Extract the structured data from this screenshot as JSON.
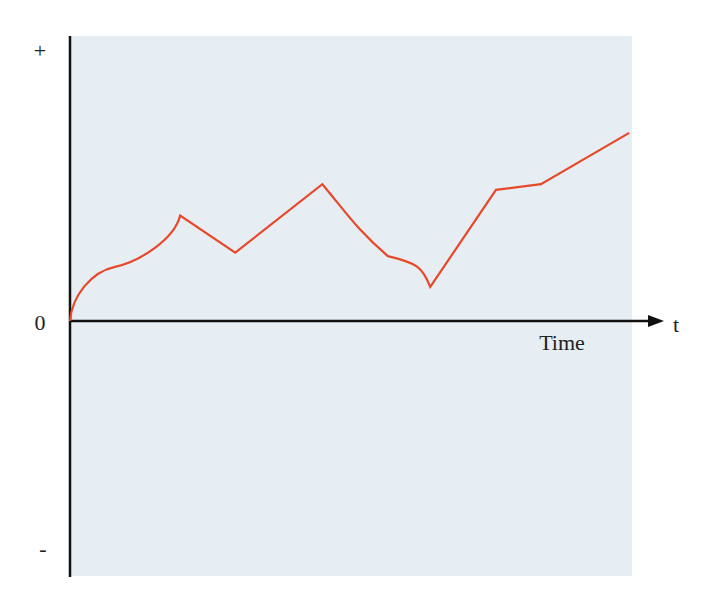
{
  "chart_data": {
    "type": "line",
    "title": "",
    "xlabel": "Time",
    "ylabel": "",
    "x_axis_end_label": "t",
    "y_tick_labels": {
      "top": "+",
      "zero": "0",
      "bottom": "-"
    },
    "grid": false,
    "legend": null,
    "colors": {
      "line": "#e8482a",
      "background": "#e6eef3",
      "axis": "#111111"
    },
    "note": "Qualitative schematic; values in relative units (0 = x-axis, +1 = top of plot, -1 = bottom). x in relative time 0..1.",
    "xlim": [
      0,
      1
    ],
    "ylim": [
      -1,
      1
    ],
    "series": [
      {
        "name": "value",
        "points": [
          {
            "x": 0.0,
            "y": 0.0
          },
          {
            "x": 0.02,
            "y": 0.1
          },
          {
            "x": 0.08,
            "y": 0.19
          },
          {
            "x": 0.15,
            "y": 0.25
          },
          {
            "x": 0.196,
            "y": 0.37
          },
          {
            "x": 0.294,
            "y": 0.24
          },
          {
            "x": 0.449,
            "y": 0.48
          },
          {
            "x": 0.53,
            "y": 0.3
          },
          {
            "x": 0.6,
            "y": 0.21
          },
          {
            "x": 0.641,
            "y": 0.12
          },
          {
            "x": 0.758,
            "y": 0.46
          },
          {
            "x": 0.838,
            "y": 0.48
          },
          {
            "x": 0.995,
            "y": 0.66
          }
        ]
      }
    ]
  },
  "labels": {
    "plus": "+",
    "zero": "0",
    "minus": "-",
    "t": "t",
    "time": "Time"
  }
}
